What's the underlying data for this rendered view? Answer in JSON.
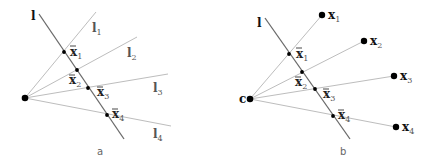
{
  "panel_a": {
    "caption": "a",
    "main_line_label": "l",
    "ray_labels": [
      {
        "base": "l",
        "sub": "1"
      },
      {
        "base": "l",
        "sub": "2"
      },
      {
        "base": "l",
        "sub": "3"
      },
      {
        "base": "l",
        "sub": "4"
      }
    ],
    "point_labels": [
      {
        "base": "x",
        "sub": "1"
      },
      {
        "base": "x",
        "sub": "2"
      },
      {
        "base": "x",
        "sub": "3"
      },
      {
        "base": "x",
        "sub": "4"
      }
    ]
  },
  "panel_b": {
    "caption": "b",
    "main_line_label": "l",
    "center_label": "c",
    "endpoint_labels": [
      {
        "base": "x",
        "sub": "1"
      },
      {
        "base": "x",
        "sub": "2"
      },
      {
        "base": "x",
        "sub": "3"
      },
      {
        "base": "x",
        "sub": "4"
      }
    ],
    "point_labels": [
      {
        "base": "x",
        "sub": "1"
      },
      {
        "base": "x",
        "sub": "2"
      },
      {
        "base": "x",
        "sub": "3"
      },
      {
        "base": "x",
        "sub": "4"
      }
    ]
  }
}
